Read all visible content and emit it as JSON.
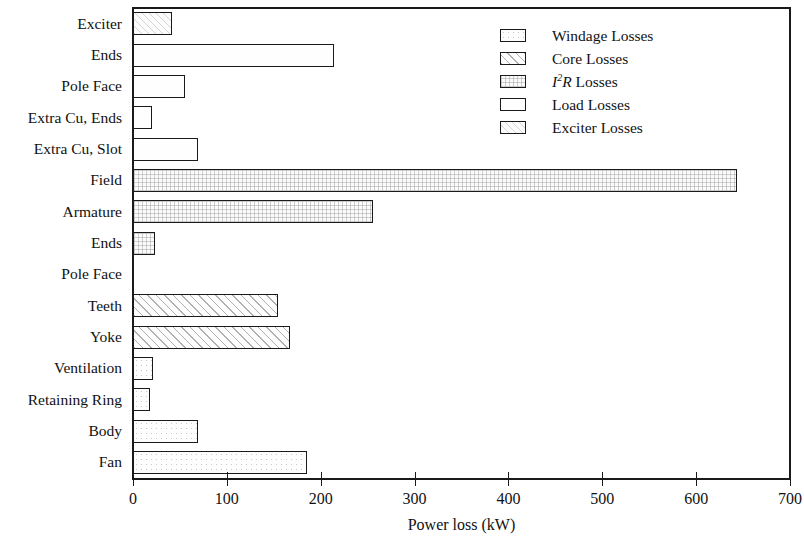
{
  "chart_data": {
    "type": "bar",
    "orientation": "horizontal",
    "title": "",
    "xlabel": "Power loss (kW)",
    "ylabel": "",
    "xlim": [
      0,
      700
    ],
    "xticks": [
      0,
      100,
      200,
      300,
      400,
      500,
      600,
      700
    ],
    "grid": false,
    "legend_position": "top-right",
    "categories": [
      "Exciter",
      "Ends",
      "Pole Face",
      "Extra Cu, Ends",
      "Extra Cu, Slot",
      "Field",
      "Armature",
      "Ends",
      "Pole Face",
      "Teeth",
      "Yoke",
      "Ventilation",
      "Retaining Ring",
      "Body",
      "Fan"
    ],
    "values": [
      42,
      214,
      55,
      20,
      69,
      644,
      256,
      23,
      0,
      154,
      167,
      21,
      18,
      69,
      185
    ],
    "bar_series": [
      "Exciter Losses",
      "Load Losses",
      "Load Losses",
      "Load Losses",
      "Load Losses",
      "I2R Losses",
      "I2R Losses",
      "I2R Losses",
      "I2R Losses",
      "Core Losses",
      "Core Losses",
      "Windage Losses",
      "Windage Losses",
      "Windage Losses",
      "Windage Losses"
    ],
    "legend": [
      {
        "label": "Windage Losses",
        "pattern": "dotted"
      },
      {
        "label": "Core Losses",
        "pattern": "diagonal-hatch"
      },
      {
        "label": "I2R Losses",
        "label_html": "<i>I</i><sup>2</sup><i>R</i> Losses",
        "pattern": "cross-hatch"
      },
      {
        "label": "Load Losses",
        "pattern": "solid-light"
      },
      {
        "label": "Exciter Losses",
        "pattern": "fine-hatch"
      }
    ]
  },
  "axis": {
    "x_title": "Power loss (kW)",
    "x_ticklabels": [
      "0",
      "100",
      "200",
      "300",
      "400",
      "500",
      "600",
      "700"
    ]
  }
}
